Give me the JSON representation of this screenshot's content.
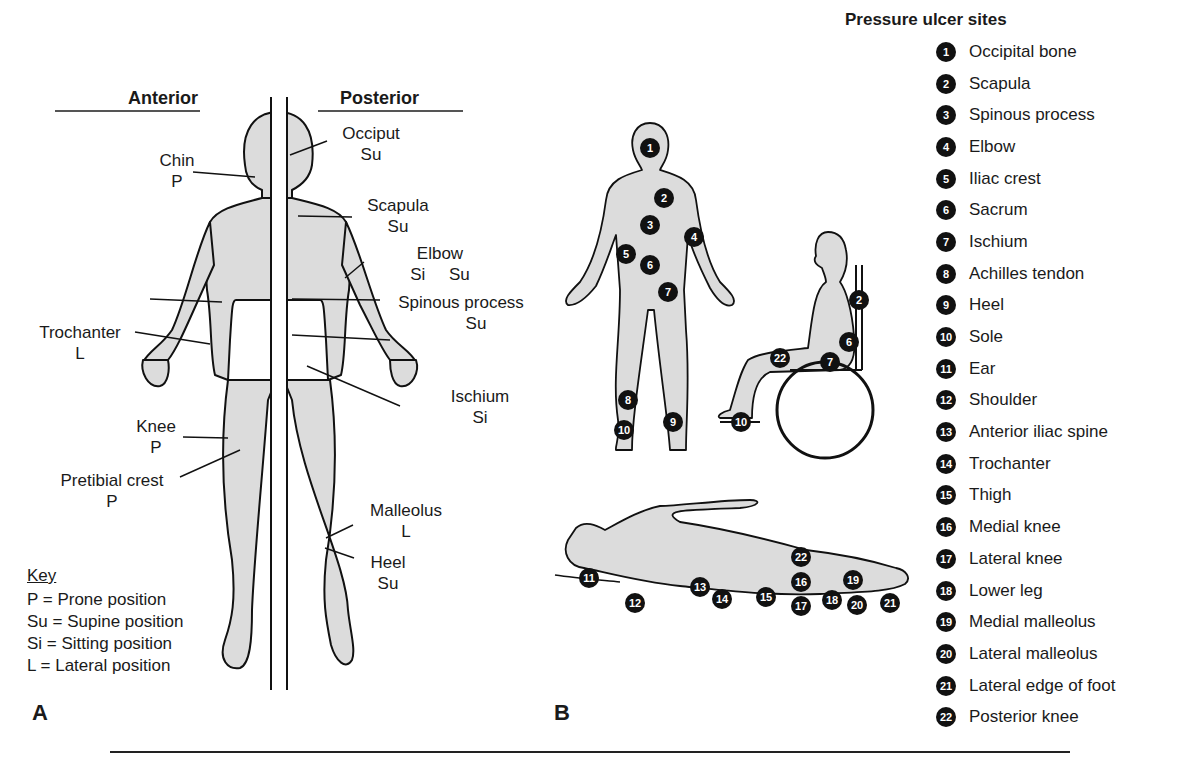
{
  "panel_a": {
    "letter": "A",
    "headers": {
      "anterior": "Anterior",
      "posterior": "Posterior"
    },
    "labels": [
      {
        "id": "chin",
        "name": "Chin",
        "position": "P"
      },
      {
        "id": "trochanter",
        "name": "Trochanter",
        "position": "L"
      },
      {
        "id": "knee",
        "name": "Knee",
        "position": "P"
      },
      {
        "id": "pretibial",
        "name": "Pretibial crest",
        "position": "P"
      },
      {
        "id": "occiput",
        "name": "Occiput",
        "position": "Su"
      },
      {
        "id": "scapula",
        "name": "Scapula",
        "position": "Su"
      },
      {
        "id": "elbow",
        "name": "Elbow",
        "position": "Si     Su"
      },
      {
        "id": "spinous",
        "name": "Spinous process",
        "position": "Su"
      },
      {
        "id": "ischium",
        "name": "Ischium",
        "position": "Si"
      },
      {
        "id": "malleolus",
        "name": "Malleolus",
        "position": "L"
      },
      {
        "id": "heel",
        "name": "Heel",
        "position": "Su"
      }
    ],
    "key": {
      "title": "Key",
      "entries": [
        "P = Prone position",
        "Su = Supine position",
        "Si = Sitting position",
        "L = Lateral position"
      ]
    }
  },
  "panel_b": {
    "letter": "B",
    "legend_title": "Pressure ulcer sites",
    "sites": [
      {
        "n": "1",
        "name": "Occipital bone"
      },
      {
        "n": "2",
        "name": "Scapula"
      },
      {
        "n": "3",
        "name": "Spinous process"
      },
      {
        "n": "4",
        "name": "Elbow"
      },
      {
        "n": "5",
        "name": "Iliac crest"
      },
      {
        "n": "6",
        "name": "Sacrum"
      },
      {
        "n": "7",
        "name": "Ischium"
      },
      {
        "n": "8",
        "name": "Achilles tendon"
      },
      {
        "n": "9",
        "name": "Heel"
      },
      {
        "n": "10",
        "name": "Sole"
      },
      {
        "n": "11",
        "name": "Ear"
      },
      {
        "n": "12",
        "name": "Shoulder"
      },
      {
        "n": "13",
        "name": "Anterior iliac spine"
      },
      {
        "n": "14",
        "name": "Trochanter"
      },
      {
        "n": "15",
        "name": "Thigh"
      },
      {
        "n": "16",
        "name": "Medial knee"
      },
      {
        "n": "17",
        "name": "Lateral knee"
      },
      {
        "n": "18",
        "name": "Lower leg"
      },
      {
        "n": "19",
        "name": "Medial malleolus"
      },
      {
        "n": "20",
        "name": "Lateral malleolus"
      },
      {
        "n": "21",
        "name": "Lateral edge of foot"
      },
      {
        "n": "22",
        "name": "Posterior knee"
      }
    ],
    "figure_markers": {
      "standing_posterior": [
        "1",
        "2",
        "3",
        "4",
        "5",
        "6",
        "7",
        "8",
        "9",
        "10"
      ],
      "sitting": [
        "2",
        "6",
        "7",
        "22",
        "10"
      ],
      "lying_lateral": [
        "11",
        "12",
        "13",
        "14",
        "15",
        "16",
        "17",
        "18",
        "19",
        "20",
        "21",
        "22"
      ]
    }
  },
  "colors": {
    "body_fill": "#dcdcdc",
    "outline": "#111111",
    "marker": "#111111",
    "marker_text": "#ffffff"
  }
}
